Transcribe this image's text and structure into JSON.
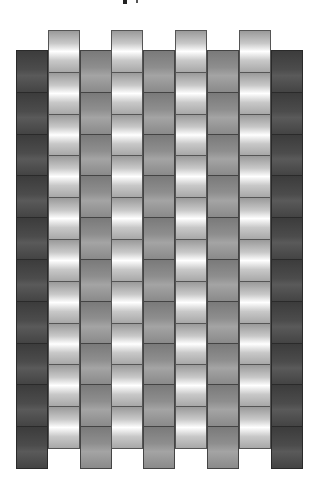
{
  "title": "",
  "weave": {
    "row_height": 41.8,
    "rows_per_column": 10,
    "columns": [
      {
        "x": 16,
        "top": 50,
        "shade": "dark"
      },
      {
        "x": 48,
        "top": 30,
        "shade": "light"
      },
      {
        "x": 80,
        "top": 50,
        "shade": "gray"
      },
      {
        "x": 111,
        "top": 30,
        "shade": "light"
      },
      {
        "x": 143,
        "top": 50,
        "shade": "gray"
      },
      {
        "x": 175,
        "top": 30,
        "shade": "light"
      },
      {
        "x": 207,
        "top": 50,
        "shade": "gray"
      },
      {
        "x": 239,
        "top": 30,
        "shade": "light"
      },
      {
        "x": 271,
        "top": 50,
        "shade": "dark"
      }
    ],
    "colors": {
      "light": "#ffffff",
      "gray": "#8e8e8e",
      "dark": "#4a4a4a",
      "divider": "#3a3a3a",
      "background": "#ffffff"
    }
  }
}
